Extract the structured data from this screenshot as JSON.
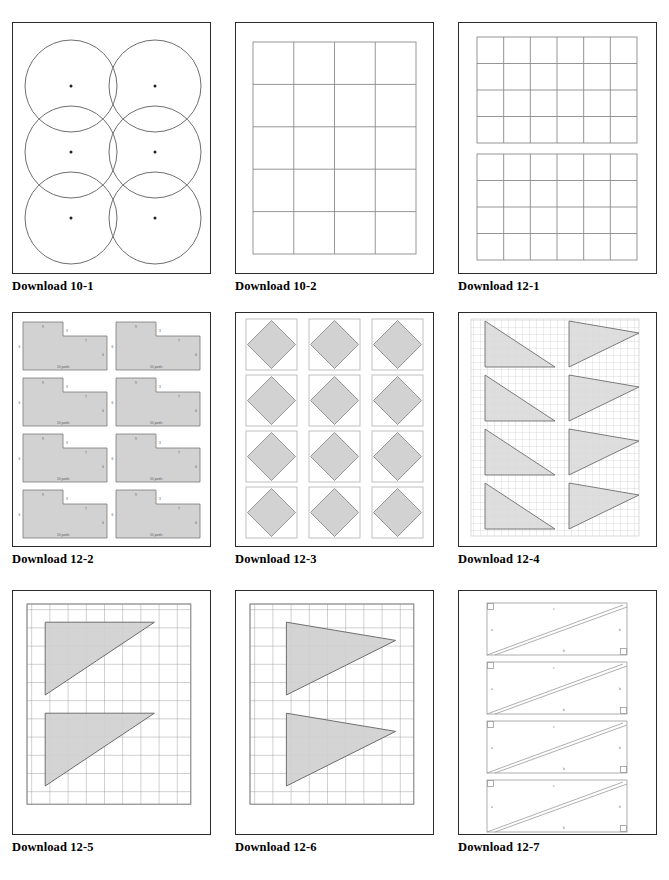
{
  "document": {
    "type": "worksheet-contact-sheet",
    "page_width": 669,
    "page_height": 880,
    "background": "#ffffff",
    "columns": 3,
    "rows": 3
  },
  "style": {
    "frame_border": "#2b2b2b",
    "grid_line": "#8a8a8a",
    "grid_line_light": "#b9b9b9",
    "shape_fill": "#d2d2d2",
    "shape_stroke": "#7a7a7a",
    "outline_only_stroke": "#9a9a9a",
    "label_text": "#555555",
    "caption_color": "#000000"
  },
  "panels": [
    {
      "id": "download-10-1",
      "caption": "Download 10-1",
      "content_type": "circles",
      "layout": {
        "cols": 2,
        "rows": 3,
        "count": 6
      },
      "description": "Six tangent circles arranged two across and three down, each marked with a small center dot."
    },
    {
      "id": "download-10-2",
      "caption": "Download 10-2",
      "content_type": "rectangle-grid",
      "layout": {
        "cols": 4,
        "rows": 5,
        "count": 20
      },
      "description": "Blank 4 by 5 grid of rectangles."
    },
    {
      "id": "download-12-1",
      "caption": "Download 12-1",
      "content_type": "double-rectangle-grid",
      "layout": {
        "cols": 6,
        "rows": 4,
        "blocks": 2
      },
      "description": "Two separate 6 by 4 grids of rectangles stacked with a gap between them."
    },
    {
      "id": "download-12-2",
      "caption": "Download 12-2",
      "content_type": "l-shaped-polygons",
      "layout": {
        "cols": 2,
        "rows": 4,
        "count": 8
      },
      "shape_labels": [
        "9",
        "3",
        "7",
        "4",
        "6",
        "2"
      ],
      "unit_label": "10 yards",
      "description": "Eight shaded L-shaped (rectilinear) figures with side length labels and a yard scale note."
    },
    {
      "id": "download-12-3",
      "caption": "Download 12-3",
      "content_type": "inscribed-diamonds",
      "layout": {
        "cols": 3,
        "rows": 4,
        "count": 12
      },
      "description": "Twelve shaded diamonds (rotated squares) each inscribed inside an outlined square."
    },
    {
      "id": "download-12-4",
      "caption": "Download 12-4",
      "content_type": "triangles-on-fine-grid",
      "layout": {
        "cols": 2,
        "rows": 4,
        "count": 8,
        "grid_cols": 24,
        "grid_rows": 30
      },
      "description": "Fine graph grid with eight shaded triangles: left column right triangles with the right angle at top-left, right column triangles pointing to the right."
    },
    {
      "id": "download-12-5",
      "caption": "Download 12-5",
      "content_type": "triangles-on-coarse-grid",
      "layout": {
        "count": 2,
        "grid_cols": 9,
        "grid_rows": 11
      },
      "description": "Coarse square grid with two identical shaded right triangles whose hypotenuse rises to the right."
    },
    {
      "id": "download-12-6",
      "caption": "Download 12-6",
      "content_type": "triangles-on-coarse-grid",
      "layout": {
        "count": 2,
        "grid_cols": 9,
        "grid_rows": 11
      },
      "description": "Coarse square grid with two shaded triangles pointing to the right."
    },
    {
      "id": "download-12-7",
      "caption": "Download 12-7",
      "content_type": "rectangles-with-diagonals",
      "layout": {
        "count": 4
      },
      "side_labels": [
        "a",
        "b",
        "c"
      ],
      "description": "Four outlined rectangles, each split by two near-parallel diagonals forming right triangles, with right-angle markers at the top-left and bottom-right corners and lettered side labels."
    }
  ]
}
